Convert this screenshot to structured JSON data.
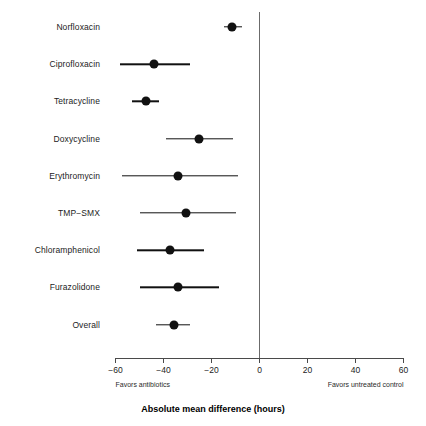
{
  "chart_data": {
    "type": "scatter",
    "subtype": "forest-plot",
    "title": "",
    "xlabel": "Absolute mean difference (hours)",
    "ylabel": "",
    "xlim": [
      -60,
      60
    ],
    "xticks": [
      -60,
      -40,
      -20,
      0,
      20,
      40,
      60
    ],
    "xtick_labels": [
      "−60",
      "−40",
      "−20",
      "0",
      "20",
      "40",
      "60"
    ],
    "grid": false,
    "reference_line": 0,
    "legend": null,
    "annotations": {
      "left": "Favors antibiotics",
      "right": "Favors untreated control"
    },
    "categories": [
      "Norfloxacin",
      "Ciprofloxacin",
      "Tetracycline",
      "Doxycycline",
      "Erythromycin",
      "TMP−SMX",
      "Chloramphenicol",
      "Furazolidone",
      "Overall"
    ],
    "rows": [
      {
        "label": "Norfloxacin",
        "estimate": -11.5,
        "ci_low": -15.0,
        "ci_high": -7.5
      },
      {
        "label": "Ciprofloxacin",
        "estimate": -43.8,
        "ci_low": -58.0,
        "ci_high": -29.0
      },
      {
        "label": "Tetracycline",
        "estimate": -47.5,
        "ci_low": -53.0,
        "ci_high": -42.0
      },
      {
        "label": "Doxycycline",
        "estimate": -25.4,
        "ci_low": -39.0,
        "ci_high": -11.0
      },
      {
        "label": "Erythromycin",
        "estimate": -33.8,
        "ci_low": -57.5,
        "ci_high": -8.8
      },
      {
        "label": "TMP−SMX",
        "estimate": -30.8,
        "ci_low": -50.0,
        "ci_high": -10.0
      },
      {
        "label": "Chloramphenicol",
        "estimate": -37.5,
        "ci_low": -51.0,
        "ci_high": -23.0
      },
      {
        "label": "Furazolidone",
        "estimate": -33.8,
        "ci_low": -50.0,
        "ci_high": -17.0
      },
      {
        "label": "Overall",
        "estimate": -35.8,
        "ci_low": -43.0,
        "ci_high": -29.0
      }
    ],
    "colors": {
      "point": "#111111",
      "ci": "#111111",
      "axis": "#4a4a4a",
      "reference": "#6b6b6b",
      "text": "#1c1c1c",
      "background": "#ffffff"
    }
  }
}
